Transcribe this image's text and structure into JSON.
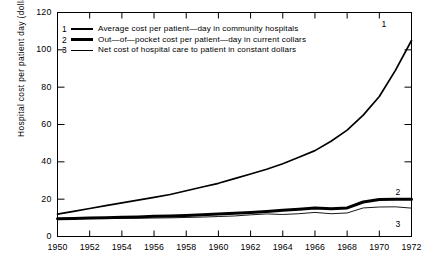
{
  "chart_data": {
    "type": "line",
    "title": "",
    "xlabel": "",
    "ylabel": "Hospital cost per patient day (dollars)",
    "xlim": [
      1950,
      1972
    ],
    "ylim": [
      0,
      120
    ],
    "grid": false,
    "legend_position": "upper-left-inside",
    "x_ticks": [
      "1950",
      "1952",
      "1954",
      "1956",
      "1958",
      "1960",
      "1962",
      "1964",
      "1966",
      "1968",
      "1970",
      "1972"
    ],
    "y_ticks": [
      "0",
      "20",
      "40",
      "60",
      "80",
      "100",
      "120"
    ],
    "x": [
      1950,
      1951,
      1952,
      1953,
      1954,
      1955,
      1956,
      1957,
      1958,
      1959,
      1960,
      1961,
      1962,
      1963,
      1964,
      1965,
      1966,
      1967,
      1968,
      1969,
      1970,
      1971,
      1972
    ],
    "series": [
      {
        "name": "Average cost per patient-day in community hospitals",
        "key": "1",
        "label": "1",
        "line_weight": "medium",
        "values": [
          12,
          13.5,
          15,
          16.5,
          18,
          19.5,
          21,
          22.5,
          24.5,
          26.5,
          28.5,
          31,
          33.5,
          36,
          39,
          42.5,
          46,
          51,
          57,
          65,
          75,
          89,
          105
        ]
      },
      {
        "name": "Out-of-pocket cost per patient-day in current collars",
        "key": "2",
        "label": "2",
        "line_weight": "heavy",
        "values": [
          9.5,
          9.7,
          9.9,
          10.1,
          10.3,
          10.5,
          10.8,
          11,
          11.3,
          11.6,
          12,
          12.4,
          12.9,
          13.4,
          14,
          14.6,
          15.3,
          14.8,
          15.3,
          18.5,
          19.8,
          20,
          20
        ]
      },
      {
        "name": "Net cost of hospital care to patient in constant dollars",
        "key": "3",
        "label": "3",
        "line_weight": "thin",
        "values": [
          9.5,
          9.6,
          9.6,
          9.7,
          9.7,
          9.8,
          9.9,
          10,
          10.2,
          10.4,
          10.7,
          11,
          11.6,
          12.1,
          11.8,
          12.2,
          12.9,
          12.2,
          12.6,
          15.3,
          15.8,
          15.9,
          15.2
        ]
      }
    ],
    "legend": [
      {
        "num": "1",
        "text": "Average cost per patient—day in community hospitals"
      },
      {
        "num": "2",
        "text": "Out—of—pocket cost per patient—day in current collars"
      },
      {
        "num": "3",
        "text": "Net cost of hospital care to patient in constant dollars"
      }
    ],
    "colors": {
      "line": "#000000",
      "background": "#ffffff",
      "axis": "#000000"
    }
  }
}
